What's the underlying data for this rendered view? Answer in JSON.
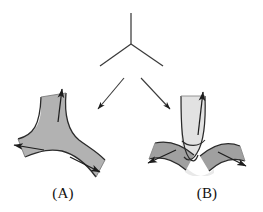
{
  "figure": {
    "title_visible": false,
    "background_color": "#ffffff",
    "width": 263,
    "height": 212,
    "stroke_color": "#2b2b2b",
    "panels": [
      {
        "id": "panel-a",
        "label": "(A)",
        "label_x": 63,
        "label_y": 198,
        "description": "trivalent-smoothing-surface",
        "fill_color": "#b2b2b2",
        "arrow_count": 3
      },
      {
        "id": "panel-b",
        "label": "(B)",
        "label_x": 207,
        "label_y": 198,
        "description": "crossing-band-surface",
        "fill_color_dark": "#a0a0a0",
        "fill_color_light": "#e2e2e2",
        "arrow_count": 3
      }
    ],
    "top_vertex": {
      "id": "trivalent-vertex",
      "description": "y-shaped-trivalent-graph",
      "stem_top_x": 131,
      "stem_top_y": 13,
      "center_x": 131,
      "center_y": 44,
      "left_end_x": 100,
      "left_end_y": 66,
      "right_end_x": 163,
      "right_end_y": 66
    },
    "transition_arrows": [
      {
        "id": "arrow-to-a",
        "from_x": 124,
        "from_y": 78,
        "to_x": 96,
        "to_y": 111
      },
      {
        "id": "arrow-to-b",
        "from_x": 141,
        "from_y": 78,
        "to_x": 172,
        "to_y": 111
      }
    ]
  }
}
